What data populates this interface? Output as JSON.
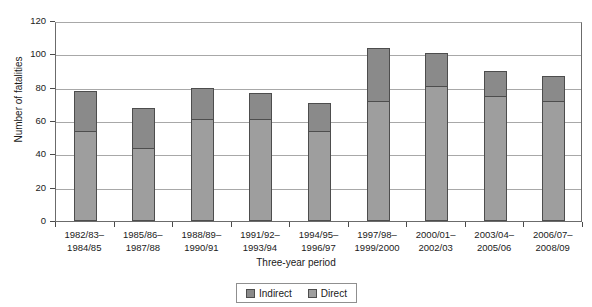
{
  "chart_data": {
    "type": "bar",
    "subtype": "stacked-vertical",
    "title": "",
    "xlabel": "Three-year period",
    "ylabel": "Number of fatalities",
    "ylim": [
      0,
      120
    ],
    "ytick_step": 20,
    "yticks": [
      "0",
      "20",
      "40",
      "60",
      "80",
      "100",
      "120"
    ],
    "grid": true,
    "grid_axis": "y",
    "legend_position": "bottom-center",
    "categories": [
      "1982/83–\n1984/85",
      "1985/86–\n1987/88",
      "1988/89–\n1990/91",
      "1991/92–\n1993/94",
      "1994/95–\n1996/97",
      "1997/98–\n1999/2000",
      "2000/01–\n2002/03",
      "2003/04–\n2005/06",
      "2006/07–\n2008/09"
    ],
    "category_lines": [
      [
        "1982/83–",
        "1984/85"
      ],
      [
        "1985/86–",
        "1987/88"
      ],
      [
        "1988/89–",
        "1990/91"
      ],
      [
        "1991/92–",
        "1993/94"
      ],
      [
        "1994/95–",
        "1996/97"
      ],
      [
        "1997/98–",
        "1999/2000"
      ],
      [
        "2000/01–",
        "2002/03"
      ],
      [
        "2003/04–",
        "2005/06"
      ],
      [
        "2006/07–",
        "2008/09"
      ]
    ],
    "series": [
      {
        "name": "Direct",
        "color": "#9e9e9e",
        "values": [
          54,
          44,
          61,
          61,
          54,
          72,
          81,
          75,
          72
        ]
      },
      {
        "name": "Indirect",
        "color": "#8a8a8a",
        "values": [
          24,
          24,
          19,
          16,
          17,
          32,
          20,
          15,
          15
        ]
      }
    ],
    "totals": [
      78,
      68,
      80,
      77,
      71,
      104,
      101,
      90,
      87
    ]
  },
  "legend": {
    "items": [
      {
        "label": "Indirect",
        "color": "#8a8a8a"
      },
      {
        "label": "Direct",
        "color": "#9e9e9e"
      }
    ]
  },
  "colors": {
    "indirect": "#8a8a8a",
    "direct": "#9e9e9e",
    "bar_border": "#4d4d4d",
    "grid": "#a8a8a8",
    "axis": "#6b6b6b",
    "text": "#1a1a1a",
    "background": "#ffffff"
  }
}
